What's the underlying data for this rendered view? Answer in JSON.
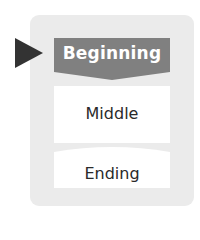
{
  "diagram": {
    "pointer": {
      "icon": "triangle-right-icon",
      "color": "#333333"
    },
    "panel": {
      "background": "#ebebeb"
    },
    "stages": [
      {
        "label": "Beginning",
        "fill": "#808080",
        "text_color": "#ffffff",
        "active": true
      },
      {
        "label": "Middle",
        "fill": "#ffffff",
        "text_color": "#2a2a2a",
        "active": false
      },
      {
        "label": "Ending",
        "fill": "#ffffff",
        "text_color": "#2a2a2a",
        "active": false
      }
    ]
  }
}
